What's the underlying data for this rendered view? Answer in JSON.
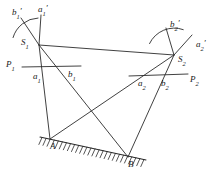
{
  "figure": {
    "stroke_color": "#2b2b2b",
    "background_color": "#ffffff",
    "width": 217,
    "height": 183
  },
  "labels": {
    "b1_prime": {
      "base": "b",
      "sub": "1",
      "prime": "′",
      "x": 12,
      "y": 8
    },
    "a1_prime": {
      "base": "a",
      "sub": "1",
      "prime": "′",
      "x": 38,
      "y": 5
    },
    "b2_prime": {
      "base": "b",
      "sub": "2",
      "prime": "′",
      "x": 170,
      "y": 20
    },
    "a2_prime": {
      "base": "a",
      "sub": "2",
      "prime": "′",
      "x": 196,
      "y": 40
    },
    "S1": {
      "base": "S",
      "sub": "1",
      "prime": "",
      "x": 21,
      "y": 38
    },
    "S2": {
      "base": "S",
      "sub": "2",
      "prime": "",
      "x": 178,
      "y": 55
    },
    "P1": {
      "base": "P",
      "sub": "1",
      "prime": "",
      "x": 6,
      "y": 60
    },
    "P2": {
      "base": "P",
      "sub": "2",
      "prime": "",
      "x": 190,
      "y": 75
    },
    "a1": {
      "base": "a",
      "sub": "1",
      "prime": "",
      "x": 33,
      "y": 72
    },
    "b1": {
      "base": "b",
      "sub": "1",
      "prime": "",
      "x": 68,
      "y": 70
    },
    "a2": {
      "base": "a",
      "sub": "2",
      "prime": "",
      "x": 138,
      "y": 79
    },
    "b2": {
      "base": "b",
      "sub": "2",
      "prime": "",
      "x": 161,
      "y": 79
    },
    "A": {
      "base": "A",
      "sub": "",
      "prime": "",
      "x": 50,
      "y": 142
    },
    "B": {
      "base": "B",
      "sub": "",
      "prime": "",
      "x": 128,
      "y": 160
    }
  },
  "geometry": {
    "points": {
      "S1": [
        39,
        45
      ],
      "S2": [
        174,
        55
      ],
      "A": [
        50,
        139
      ],
      "B": [
        128,
        157
      ]
    },
    "sight_lines": [
      {
        "name": "S1-S2-baseline",
        "from": "S1",
        "to": "S2"
      },
      {
        "name": "S1-to-A",
        "from": "S1",
        "to": "A"
      },
      {
        "name": "S1-to-B",
        "from": "S1",
        "to": "B"
      },
      {
        "name": "S2-to-A",
        "from": "S2",
        "to": "A"
      },
      {
        "name": "S2-to-B",
        "from": "S2",
        "to": "B"
      }
    ],
    "reference_lines": [
      {
        "name": "P1-horizontal",
        "x1": 22,
        "y1": 67,
        "x2": 81,
        "y2": 66
      },
      {
        "name": "P2-horizontal",
        "x1": 129,
        "y1": 76,
        "x2": 188,
        "y2": 74
      }
    ],
    "arcs": [
      {
        "name": "arc-S1",
        "cx": 39,
        "cy": 45,
        "r": 27,
        "start_deg": 196,
        "end_deg": 268
      },
      {
        "name": "arc-S2",
        "cx": 174,
        "cy": 55,
        "r": 27,
        "start_deg": 205,
        "end_deg": 290
      }
    ],
    "tick_rays": [
      {
        "name": "ray-S1-b1prime",
        "x1": 39,
        "y1": 45,
        "x2": 21,
        "y2": 18
      },
      {
        "name": "ray-S1-a1prime",
        "x1": 39,
        "y1": 45,
        "x2": 41,
        "y2": 15
      },
      {
        "name": "ray-S2-b2prime",
        "x1": 174,
        "y1": 55,
        "x2": 166,
        "y2": 28
      },
      {
        "name": "ray-S2-a2prime",
        "x1": 174,
        "y1": 55,
        "x2": 192,
        "y2": 35
      }
    ],
    "ground": {
      "name": "ground-line",
      "x1": 40,
      "y1": 137,
      "x2": 146,
      "y2": 160,
      "hatch_count": 26,
      "hatch_length": 7
    }
  }
}
